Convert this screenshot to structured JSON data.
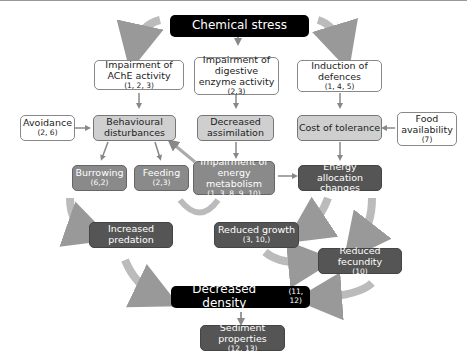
{
  "nodes": {
    "chemical_stress": {
      "label": "Chemical stress"
    },
    "ache": {
      "label": "Impairment of AChE activity",
      "ref": "(1, 2, 3)"
    },
    "digestive": {
      "label": "Impairment of digestive enzyme activity",
      "ref": "(2,3)"
    },
    "defences": {
      "label": "Induction of defences",
      "ref": "(1, 4, 5)"
    },
    "avoidance": {
      "label": "Avoidance",
      "ref": "(2, 6)"
    },
    "behaviour": {
      "label": "Behavioural disturbances"
    },
    "assimilation": {
      "label": "Decreased assimilation"
    },
    "tolerance": {
      "label": "Cost of tolerance"
    },
    "food": {
      "label": "Food availability",
      "ref": "(7)"
    },
    "burrowing": {
      "label": "Burrowing",
      "ref": "(6,2)"
    },
    "feeding": {
      "label": "Feeding",
      "ref": "(2,3)"
    },
    "energy_metabolism": {
      "label": "Impairment of energy metabolism",
      "ref": "(1, 3, 8, 9, 10)"
    },
    "energy_allocation": {
      "label": "Energy allocation changes"
    },
    "predation": {
      "label": "Increased predation"
    },
    "growth": {
      "label": "Reduced growth",
      "ref": "(3, 10,)"
    },
    "fecundity": {
      "label": "Reduced fecundity",
      "ref": "(10)"
    },
    "density": {
      "label": "Decreased  density",
      "ref": "(11, 12)"
    },
    "sediment": {
      "label": "Sediment properties",
      "ref": "(12, 13)"
    }
  }
}
